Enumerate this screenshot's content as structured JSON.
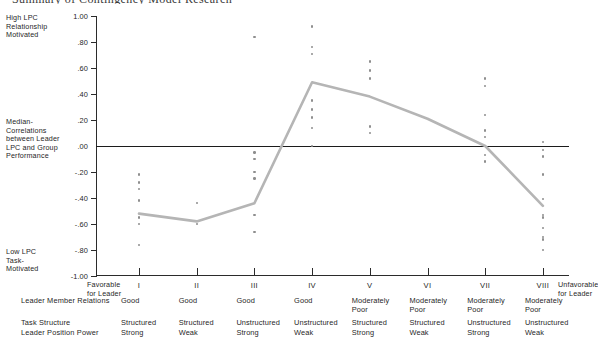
{
  "title": "Summary of Contingency Model Research",
  "axis": {
    "high_caption": "High LPC\nRelationship\nMotivated",
    "mid_caption": "Median-\nCorrelations\nbetween Leader\nLPC and Group\nPerformance",
    "low_caption": "Low LPC\nTask-\nMotivated",
    "favorable_caption": "Favorable\nfor Leader",
    "unfavorable_caption": "Unfavorable\nfor Leader",
    "y_ticks": [
      "1.00",
      ".80",
      ".60",
      ".40",
      ".20",
      ".00",
      "-.20",
      "-.40",
      "-.60",
      "-.80",
      "-1.00"
    ],
    "x_ticks": [
      "I",
      "II",
      "III",
      "IV",
      "V",
      "VI",
      "VII",
      "VIII"
    ]
  },
  "table": {
    "row_labels": [
      "Leader Member Relations",
      "Task Structure",
      "Leader Position Power"
    ],
    "columns": [
      {
        "relations": "Good",
        "structure": "Structured",
        "power": "Strong"
      },
      {
        "relations": "Good",
        "structure": "Structured",
        "power": "Weak"
      },
      {
        "relations": "Good",
        "structure": "Unstructured",
        "power": "Strong"
      },
      {
        "relations": "Good",
        "structure": "Unstructured",
        "power": "Weak"
      },
      {
        "relations": "Moderately\nPoor",
        "structure": "Structured",
        "power": "Strong"
      },
      {
        "relations": "Moderately\nPoor",
        "structure": "Structured",
        "power": "Weak"
      },
      {
        "relations": "Moderately\nPoor",
        "structure": "Unstructured",
        "power": "Strong"
      },
      {
        "relations": "Moderately\nPoor",
        "structure": "Unstructured",
        "power": "Weak"
      }
    ]
  },
  "colors": {
    "axis": "#2b2b2b",
    "zero_line": "#1c1c1c",
    "dot": "#8e8e8e",
    "median_line": "#b5b5b5"
  },
  "chart_data": {
    "type": "scatter",
    "title": "Summary of Contingency Model Research",
    "xlabel": "Octant (situational favorableness for leader)",
    "ylabel": "Median Correlations between Leader LPC and Group Performance",
    "ylim": [
      -1.0,
      1.0
    ],
    "ytick_values": [
      1.0,
      0.8,
      0.6,
      0.4,
      0.2,
      0.0,
      -0.2,
      -0.4,
      -0.6,
      -0.8,
      -1.0
    ],
    "categories": [
      "I",
      "II",
      "III",
      "IV",
      "V",
      "VI",
      "VII",
      "VIII"
    ],
    "grid": false,
    "legend": "none",
    "zero_reference_line": 0.0,
    "median_series": {
      "name": "Median correlation",
      "values": [
        -0.52,
        -0.58,
        -0.44,
        0.49,
        0.38,
        0.21,
        0.0,
        -0.46
      ]
    },
    "scatter_points": [
      {
        "category": "I",
        "values": [
          -0.22,
          -0.28,
          -0.33,
          -0.42,
          -0.55,
          -0.6,
          -0.76
        ]
      },
      {
        "category": "II",
        "values": [
          -0.44,
          -0.6
        ]
      },
      {
        "category": "III",
        "values": [
          0.84,
          -0.05,
          -0.1,
          -0.2,
          -0.25,
          -0.53,
          -0.66
        ]
      },
      {
        "category": "IV",
        "values": [
          0.92,
          0.76,
          0.71,
          0.35,
          0.28,
          0.22,
          0.14,
          0.0
        ]
      },
      {
        "category": "V",
        "values": [
          0.65,
          0.58,
          0.52,
          0.15,
          0.1
        ]
      },
      {
        "category": "VI",
        "values": []
      },
      {
        "category": "VII",
        "values": [
          0.52,
          0.46,
          0.24,
          0.12,
          0.07,
          -0.07,
          -0.12
        ]
      },
      {
        "category": "VIII",
        "values": [
          0.03,
          -0.03,
          -0.08,
          -0.22,
          -0.41,
          -0.53,
          -0.55,
          -0.63,
          -0.7,
          -0.72,
          -0.8
        ]
      }
    ]
  }
}
